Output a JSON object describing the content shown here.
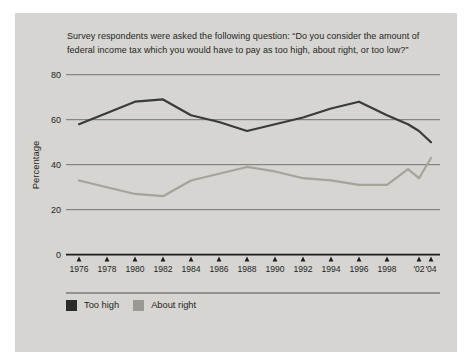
{
  "panel": {
    "background": "#d6d5d2"
  },
  "title": "Survey respondents were asked the following question: “Do you consider the amount of federal income tax which you would have to pay as too high, about right, or too low?”",
  "chart_data": {
    "type": "line",
    "title": "",
    "xlabel": "",
    "ylabel": "Percentage",
    "ylim": [
      0,
      80
    ],
    "yticks": [
      0,
      20,
      40,
      60,
      80
    ],
    "grid": true,
    "legend_position": "bottom-left",
    "x": [
      1976,
      1978,
      1980,
      1982,
      1984,
      1986,
      1988,
      1990,
      1992,
      1994,
      1996,
      1998,
      2000,
      2002,
      2004
    ],
    "xticks": [
      {
        "year": 1976,
        "label": "1976"
      },
      {
        "year": 1978,
        "label": "1978"
      },
      {
        "year": 1980,
        "label": "1980"
      },
      {
        "year": 1982,
        "label": "1982"
      },
      {
        "year": 1984,
        "label": "1984"
      },
      {
        "year": 1986,
        "label": "1986"
      },
      {
        "year": 1988,
        "label": "1988"
      },
      {
        "year": 1990,
        "label": "1990"
      },
      {
        "year": 1992,
        "label": "1992"
      },
      {
        "year": 1994,
        "label": "1994"
      },
      {
        "year": 1996,
        "label": "1996"
      },
      {
        "year": 1998,
        "label": "1998"
      },
      {
        "year": 2002,
        "label": "'02"
      },
      {
        "year": 2004,
        "label": "'04"
      }
    ],
    "series": [
      {
        "name": "Too high",
        "color": "#3a3a38",
        "values": [
          58,
          63,
          68,
          69,
          62,
          59,
          55,
          58,
          61,
          65,
          68,
          62,
          58,
          55,
          50
        ]
      },
      {
        "name": "About right",
        "color": "#a4a39c",
        "values": [
          33,
          30,
          27,
          26,
          33,
          36,
          39,
          37,
          34,
          33,
          31,
          31,
          38,
          34,
          43
        ]
      }
    ]
  },
  "legend": {
    "items": [
      {
        "label": "Too high",
        "color": "#2b2b29"
      },
      {
        "label": "About right",
        "color": "#9a9993"
      }
    ]
  }
}
